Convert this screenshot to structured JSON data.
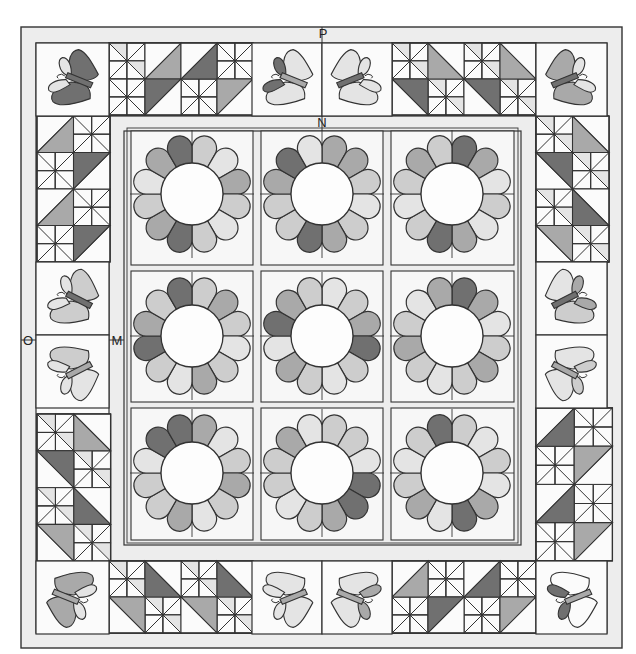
{
  "diagram": {
    "labels": [
      {
        "id": "P",
        "text": "P",
        "x": 323,
        "y": 38
      },
      {
        "id": "N",
        "text": "N",
        "x": 322,
        "y": 127
      },
      {
        "id": "O",
        "text": "O",
        "x": 28,
        "y": 345
      },
      {
        "id": "M",
        "text": "M",
        "x": 117,
        "y": 345
      }
    ],
    "palette": {
      "line": "#333333",
      "bg": "#fbfbfb",
      "strip": "#ededed",
      "shade": [
        "#fbfbfb",
        "#e4e4e4",
        "#cdcdcd",
        "#a9a9a9",
        "#707070"
      ]
    },
    "frame": {
      "outer": {
        "x": 21,
        "y": 27,
        "w": 601,
        "h": 621
      },
      "border_ring": {
        "x": 36,
        "y": 43,
        "w": 571,
        "h": 590
      },
      "inner_strip": {
        "x": 109,
        "y": 116,
        "w": 427,
        "h": 445
      },
      "center": {
        "x": 124,
        "y": 131,
        "w": 397,
        "h": 414
      }
    },
    "flowers": [
      {
        "cx": 192,
        "cy": 194,
        "shades": [
          2,
          1,
          3,
          2,
          1,
          2,
          4,
          3,
          2,
          1,
          3,
          4
        ]
      },
      {
        "cx": 322,
        "cy": 194,
        "shades": [
          3,
          3,
          2,
          1,
          2,
          3,
          4,
          2,
          2,
          3,
          4,
          1
        ]
      },
      {
        "cx": 452,
        "cy": 194,
        "shades": [
          4,
          3,
          1,
          2,
          1,
          3,
          4,
          2,
          1,
          2,
          3,
          2
        ]
      },
      {
        "cx": 192,
        "cy": 336,
        "shades": [
          2,
          3,
          2,
          1,
          2,
          3,
          1,
          2,
          4,
          3,
          2,
          4
        ]
      },
      {
        "cx": 322,
        "cy": 336,
        "shades": [
          1,
          2,
          3,
          4,
          2,
          1,
          2,
          3,
          1,
          4,
          3,
          2
        ]
      },
      {
        "cx": 452,
        "cy": 336,
        "shades": [
          4,
          3,
          1,
          2,
          3,
          2,
          1,
          2,
          3,
          2,
          1,
          3
        ]
      },
      {
        "cx": 192,
        "cy": 473,
        "shades": [
          3,
          1,
          2,
          3,
          2,
          1,
          3,
          2,
          2,
          1,
          4,
          4
        ]
      },
      {
        "cx": 322,
        "cy": 473,
        "shades": [
          2,
          2,
          1,
          4,
          4,
          3,
          2,
          1,
          2,
          2,
          3,
          1
        ]
      },
      {
        "cx": 452,
        "cy": 473,
        "shades": [
          2,
          1,
          2,
          1,
          3,
          4,
          1,
          3,
          2,
          1,
          2,
          4
        ]
      }
    ],
    "butterflies": [
      {
        "name": "top-left",
        "x": 36,
        "y": 43,
        "rot": -20,
        "flip": false,
        "wing_a": 4,
        "wing_b": 4,
        "wing_c": 1,
        "body": 4
      },
      {
        "name": "top-center-left",
        "x": 252,
        "y": 43,
        "rot": -20,
        "flip": false,
        "wing_a": 1,
        "wing_b": 1,
        "wing_c": 4,
        "body": 3
      },
      {
        "name": "top-center-right",
        "x": 322,
        "y": 43,
        "rot": 20,
        "flip": true,
        "wing_a": 1,
        "wing_b": 1,
        "wing_c": 1,
        "body": 4
      },
      {
        "name": "top-right",
        "x": 536,
        "y": 43,
        "rot": 20,
        "flip": true,
        "wing_a": 3,
        "wing_b": 3,
        "wing_c": 1,
        "body": 4
      },
      {
        "name": "left-upper",
        "x": 36,
        "y": 262,
        "rot": -15,
        "flip": false,
        "wing_a": 2,
        "wing_b": 2,
        "wing_c": 1,
        "body": 4
      },
      {
        "name": "left-lower",
        "x": 36,
        "y": 335,
        "rot": 195,
        "flip": true,
        "wing_a": 1,
        "wing_b": 2,
        "wing_c": 1,
        "body": 3
      },
      {
        "name": "right-upper",
        "x": 536,
        "y": 262,
        "rot": 15,
        "flip": true,
        "wing_a": 1,
        "wing_b": 2,
        "wing_c": 3,
        "body": 4
      },
      {
        "name": "right-lower",
        "x": 536,
        "y": 335,
        "rot": 165,
        "flip": false,
        "wing_a": 1,
        "wing_b": 1,
        "wing_c": 2,
        "body": 3
      },
      {
        "name": "bottom-left",
        "x": 36,
        "y": 561,
        "rot": 160,
        "flip": false,
        "wing_a": 3,
        "wing_b": 3,
        "wing_c": 1,
        "body": 3
      },
      {
        "name": "bottom-center-left",
        "x": 252,
        "y": 561,
        "rot": 200,
        "flip": true,
        "wing_a": 1,
        "wing_b": 1,
        "wing_c": 1,
        "body": 3
      },
      {
        "name": "bottom-center-right",
        "x": 322,
        "y": 561,
        "rot": 160,
        "flip": false,
        "wing_a": 1,
        "wing_b": 1,
        "wing_c": 3,
        "body": 3
      },
      {
        "name": "bottom-right",
        "x": 536,
        "y": 561,
        "rot": 200,
        "flip": true,
        "wing_a": 0,
        "wing_b": 0,
        "wing_c": 4,
        "body": 3
      }
    ],
    "pieced_blocks": [
      {
        "name": "top-left-pieced",
        "x": 109,
        "y": 43,
        "cols": 8,
        "rows": 4,
        "unit": 18,
        "big": [
          {
            "c": 2,
            "r": 0,
            "dir": "br",
            "shade": 3
          },
          {
            "c": 4,
            "r": 0,
            "dir": "br",
            "shade": 4
          },
          {
            "c": 2,
            "r": 2,
            "dir": "tl",
            "shade": 4
          },
          {
            "c": 6,
            "r": 2,
            "dir": "tl",
            "shade": 3
          }
        ]
      },
      {
        "name": "top-right-pieced",
        "x": 392,
        "y": 43,
        "cols": 8,
        "rows": 4,
        "unit": 18,
        "big": [
          {
            "c": 2,
            "r": 0,
            "dir": "bl",
            "shade": 3
          },
          {
            "c": 6,
            "r": 0,
            "dir": "bl",
            "shade": 3
          },
          {
            "c": 0,
            "r": 2,
            "dir": "tr",
            "shade": 4
          },
          {
            "c": 4,
            "r": 2,
            "dir": "tr",
            "shade": 4
          }
        ]
      },
      {
        "name": "left-upper-pieced",
        "x": 37,
        "y": 116,
        "cols": 4,
        "rows": 8,
        "unit": 18.25,
        "big": [
          {
            "c": 0,
            "r": 0,
            "dir": "br",
            "shade": 3
          },
          {
            "c": 2,
            "r": 2,
            "dir": "tl",
            "shade": 4
          },
          {
            "c": 0,
            "r": 4,
            "dir": "br",
            "shade": 3
          },
          {
            "c": 2,
            "r": 6,
            "dir": "tl",
            "shade": 4
          }
        ]
      },
      {
        "name": "left-lower-pieced",
        "x": 37,
        "y": 414,
        "cols": 4,
        "rows": 8,
        "unit": 18.4,
        "big": [
          {
            "c": 2,
            "r": 0,
            "dir": "bl",
            "shade": 3
          },
          {
            "c": 0,
            "r": 2,
            "dir": "tr",
            "shade": 4
          },
          {
            "c": 2,
            "r": 4,
            "dir": "bl",
            "shade": 4
          },
          {
            "c": 0,
            "r": 6,
            "dir": "tr",
            "shade": 3
          }
        ]
      },
      {
        "name": "right-upper-pieced",
        "x": 536,
        "y": 116,
        "cols": 4,
        "rows": 8,
        "unit": 18.25,
        "big": [
          {
            "c": 2,
            "r": 0,
            "dir": "bl",
            "shade": 3
          },
          {
            "c": 0,
            "r": 2,
            "dir": "tr",
            "shade": 4
          },
          {
            "c": 2,
            "r": 4,
            "dir": "bl",
            "shade": 4
          },
          {
            "c": 0,
            "r": 6,
            "dir": "tr",
            "shade": 3
          }
        ]
      },
      {
        "name": "right-lower-pieced",
        "x": 536,
        "y": 408,
        "cols": 4,
        "rows": 8,
        "unit": 19.1,
        "big": [
          {
            "c": 0,
            "r": 0,
            "dir": "br",
            "shade": 4
          },
          {
            "c": 2,
            "r": 2,
            "dir": "tl",
            "shade": 3
          },
          {
            "c": 0,
            "r": 4,
            "dir": "br",
            "shade": 4
          },
          {
            "c": 2,
            "r": 6,
            "dir": "tl",
            "shade": 3
          }
        ]
      },
      {
        "name": "bottom-left-pieced",
        "x": 109,
        "y": 561,
        "cols": 8,
        "rows": 4,
        "unit": 18,
        "big": [
          {
            "c": 2,
            "r": 0,
            "dir": "bl",
            "shade": 4
          },
          {
            "c": 6,
            "r": 0,
            "dir": "bl",
            "shade": 4
          },
          {
            "c": 0,
            "r": 2,
            "dir": "tr",
            "shade": 3
          },
          {
            "c": 4,
            "r": 2,
            "dir": "tr",
            "shade": 3
          }
        ]
      },
      {
        "name": "bottom-right-pieced",
        "x": 392,
        "y": 561,
        "cols": 8,
        "rows": 4,
        "unit": 18,
        "big": [
          {
            "c": 0,
            "r": 0,
            "dir": "br",
            "shade": 3
          },
          {
            "c": 4,
            "r": 0,
            "dir": "br",
            "shade": 4
          },
          {
            "c": 2,
            "r": 2,
            "dir": "tl",
            "shade": 4
          },
          {
            "c": 6,
            "r": 2,
            "dir": "tl",
            "shade": 3
          }
        ]
      }
    ]
  }
}
